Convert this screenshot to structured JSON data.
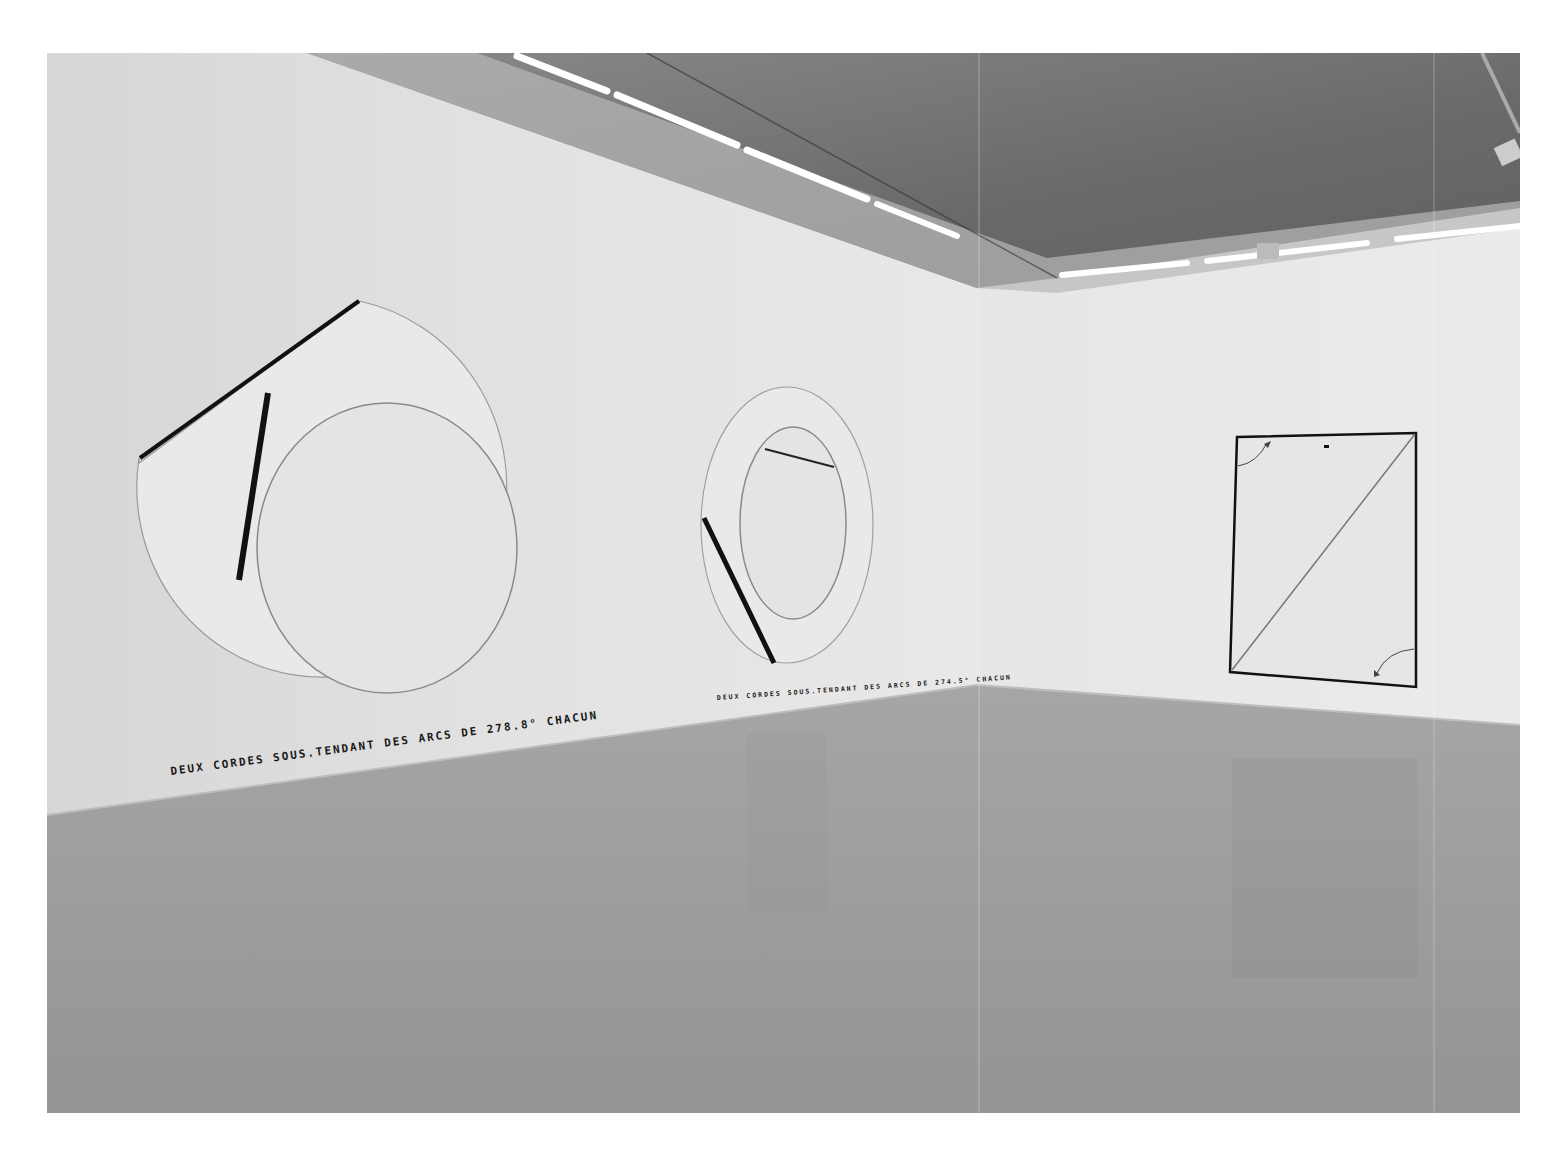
{
  "scene": {
    "description": "Gallery installation view: white walls, grey floor, fluorescent ceiling lights",
    "colors": {
      "page_background": "#ffffff",
      "left_wall": "#dedede",
      "right_wall": "#e6e6e6",
      "ceiling": "#6e6e6e",
      "floor": "#9a9a9a",
      "artwork_line": "#111111",
      "light": "#ffffff"
    }
  },
  "artworks": [
    {
      "name": "large-ring-two-chords",
      "caption": "DEUX CORDES SOUS.TENDANT DES ARCS DE 278.8° CHACUN"
    },
    {
      "name": "oval-ring-two-chords",
      "caption": "DEUX CORDES SOUS.TENDANT DES ARCS DE 274.5° CHACUN"
    },
    {
      "name": "rectangle-diagonal",
      "caption": ""
    }
  ]
}
